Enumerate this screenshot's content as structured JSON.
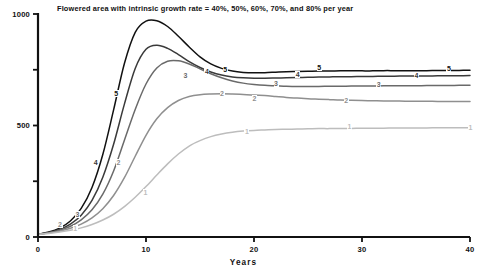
{
  "chart_data": {
    "type": "line",
    "title": "Flowered area with intrinsic growth rate = 40%, 50%, 60%, 70%, and 80% per year",
    "xlabel": "Years",
    "ylabel": "",
    "xlim": [
      0,
      40
    ],
    "ylim": [
      0,
      1000
    ],
    "grid": false,
    "legend_position": "inline-series-labels",
    "xticks": [
      0,
      10,
      20,
      30,
      40
    ],
    "xtick_labels": [
      "0",
      "10",
      "20",
      "30",
      "40"
    ],
    "yticks": [
      0,
      250,
      500,
      750,
      1000
    ],
    "ytick_labels": [
      "0",
      "",
      "500",
      "",
      "1000"
    ],
    "x": [
      0,
      1,
      2,
      3,
      4,
      5,
      6,
      7,
      8,
      9,
      10,
      11,
      12,
      13,
      14,
      15,
      16,
      17,
      18,
      19,
      20,
      21,
      22,
      23,
      24,
      25,
      26,
      27,
      28,
      29,
      30,
      31,
      32,
      33,
      34,
      35,
      36,
      37,
      38,
      39,
      40
    ],
    "series": [
      {
        "name": "5",
        "label": "5",
        "growth_rate_percent": 80,
        "color": "#111111",
        "peak_value": 970,
        "peak_year": 11.2,
        "asymptote": 745,
        "values": [
          12,
          22,
          40,
          72,
          128,
          222,
          370,
          570,
          778,
          918,
          968,
          970,
          944,
          900,
          852,
          808,
          776,
          756,
          744,
          738,
          736,
          737,
          739,
          741,
          742,
          743,
          744,
          744,
          745,
          745,
          745,
          745,
          746,
          746,
          746,
          746,
          746,
          747,
          747,
          747,
          748
        ]
      },
      {
        "name": "4",
        "label": "4",
        "growth_rate_percent": 70,
        "color": "#3a3a3a",
        "peak_value": 862,
        "peak_year": 12.6,
        "asymptote": 722,
        "values": [
          12,
          20,
          34,
          58,
          98,
          164,
          268,
          416,
          596,
          756,
          842,
          860,
          846,
          818,
          786,
          760,
          740,
          726,
          718,
          714,
          712,
          712,
          713,
          714,
          715,
          716,
          717,
          718,
          719,
          719,
          720,
          720,
          721,
          721,
          722,
          722,
          722,
          723,
          723,
          723,
          724
        ]
      },
      {
        "name": "3",
        "label": "3",
        "growth_rate_percent": 60,
        "color": "#6a6a6a",
        "peak_value": 792,
        "peak_year": 14.6,
        "asymptote": 678,
        "values": [
          12,
          19,
          30,
          48,
          77,
          122,
          192,
          296,
          434,
          572,
          686,
          758,
          788,
          790,
          776,
          754,
          732,
          714,
          700,
          690,
          684,
          680,
          678,
          676,
          675,
          675,
          675,
          676,
          676,
          677,
          677,
          677,
          678,
          678,
          678,
          678,
          679,
          679,
          679,
          680,
          680
        ]
      },
      {
        "name": "2",
        "label": "2",
        "growth_rate_percent": 50,
        "color": "#8f8f8f",
        "peak_value": 642,
        "peak_year": 21.0,
        "asymptote": 608,
        "values": [
          12,
          18,
          26,
          39,
          58,
          86,
          127,
          186,
          266,
          362,
          456,
          530,
          580,
          612,
          630,
          638,
          641,
          642,
          641,
          639,
          637,
          634,
          630,
          626,
          623,
          620,
          618,
          616,
          614,
          613,
          612,
          611,
          610,
          610,
          609,
          609,
          609,
          608,
          608,
          608,
          608
        ]
      },
      {
        "name": "1",
        "label": "1",
        "growth_rate_percent": 40,
        "color": "#bdbdbd",
        "peak_value": 490,
        "peak_year": 40,
        "asymptote": 490,
        "values": [
          12,
          16,
          22,
          30,
          41,
          56,
          76,
          102,
          136,
          178,
          226,
          278,
          328,
          372,
          408,
          432,
          450,
          462,
          470,
          475,
          478,
          480,
          482,
          483,
          484,
          485,
          486,
          486,
          487,
          487,
          488,
          488,
          488,
          489,
          489,
          489,
          489,
          490,
          490,
          490,
          490
        ]
      }
    ],
    "series_labels": [
      {
        "series": "5",
        "text": "5",
        "x": 7.2,
        "y": 640
      },
      {
        "series": "5",
        "text": "5",
        "x": 17.3,
        "y": 748
      },
      {
        "series": "5",
        "text": "5",
        "x": 26.0,
        "y": 756
      },
      {
        "series": "5",
        "text": "5",
        "x": 38.0,
        "y": 752
      },
      {
        "series": "4",
        "text": "4",
        "x": 5.3,
        "y": 330
      },
      {
        "series": "4",
        "text": "4",
        "x": 15.6,
        "y": 742
      },
      {
        "series": "4",
        "text": "4",
        "x": 24.0,
        "y": 726
      },
      {
        "series": "4",
        "text": "4",
        "x": 35.0,
        "y": 722
      },
      {
        "series": "3",
        "text": "3",
        "x": 3.6,
        "y": 100
      },
      {
        "series": "3",
        "text": "3",
        "x": 13.6,
        "y": 720
      },
      {
        "series": "3",
        "text": "3",
        "x": 22.0,
        "y": 688
      },
      {
        "series": "3",
        "text": "3",
        "x": 31.5,
        "y": 680
      },
      {
        "series": "2",
        "text": "2",
        "x": 2.0,
        "y": 52
      },
      {
        "series": "2",
        "text": "2",
        "x": 7.4,
        "y": 330
      },
      {
        "series": "2",
        "text": "2",
        "x": 17.0,
        "y": 640
      },
      {
        "series": "2",
        "text": "2",
        "x": 20.0,
        "y": 620
      },
      {
        "series": "2",
        "text": "2",
        "x": 28.5,
        "y": 608
      },
      {
        "series": "1",
        "text": "1",
        "x": 3.4,
        "y": 38
      },
      {
        "series": "1",
        "text": "1",
        "x": 9.9,
        "y": 196
      },
      {
        "series": "1",
        "text": "1",
        "x": 19.3,
        "y": 470
      },
      {
        "series": "1",
        "text": "1",
        "x": 28.8,
        "y": 492
      },
      {
        "series": "1",
        "text": "1",
        "x": 40.0,
        "y": 490
      }
    ]
  },
  "axis": {
    "color": "#111111"
  }
}
